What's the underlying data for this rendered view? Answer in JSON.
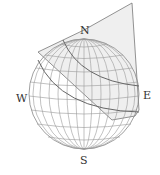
{
  "diagram": {
    "type": "celestial-sphere-with-plane",
    "labels": {
      "north": "N",
      "south": "S",
      "west": "W",
      "east": "E"
    },
    "colors": {
      "line": "#8a8a8a",
      "plane_fill": "#eeeeee",
      "plane_edge": "#777777",
      "arc": "#666666",
      "text": "#333333"
    }
  }
}
